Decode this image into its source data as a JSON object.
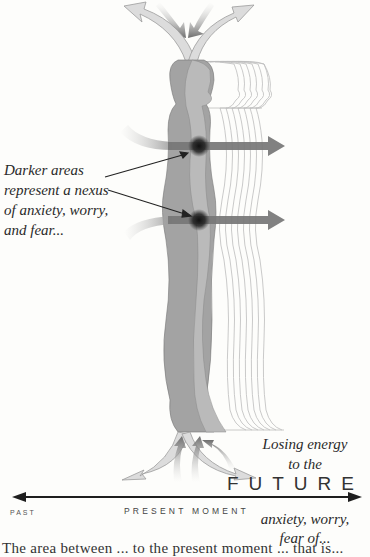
{
  "figure": {
    "type": "illustration",
    "colors": {
      "background": "#fdfdfb",
      "body_dark": "#9d9d9d",
      "body_mid": "#b9b9b9",
      "outline_light": "#c4c4c4",
      "arrow_light": "#d9d9d9",
      "arrow_dark": "#6e6e6e",
      "nexus": "#1a1a1a",
      "timeline": "#1e1e1e"
    }
  },
  "labels": {
    "nexus_line1": "Darker areas",
    "nexus_line2": "represent a nexus",
    "nexus_line3": "of anxiety, worry,",
    "nexus_line4": "and fear...",
    "energy_line1": "Losing energy",
    "energy_line2": "to the",
    "future": "FUTURE",
    "past": "PAST",
    "present": "PRESENT MOMENT",
    "fear_line1": "anxiety, worry,",
    "fear_line2": "fear of...",
    "body_text_partial": "The area between ... to the present moment ... that is..."
  }
}
